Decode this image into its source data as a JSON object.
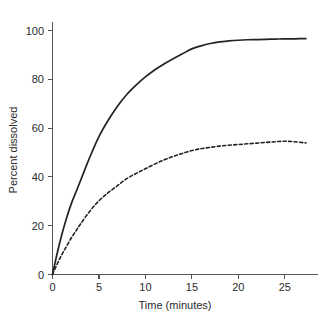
{
  "chart_data": {
    "type": "line",
    "title": "",
    "xlabel": "Time (minutes)",
    "ylabel": "Percent dissolved",
    "xlim": [
      0,
      28.6
    ],
    "ylim": [
      0,
      108
    ],
    "xticks": [
      0,
      5,
      10,
      15,
      20,
      25
    ],
    "yticks": [
      0,
      20,
      40,
      60,
      80,
      100
    ],
    "xtick_labels": [
      "0",
      "5",
      "10",
      "15",
      "20",
      "25"
    ],
    "ytick_labels": [
      "0",
      "20",
      "40",
      "60",
      "80",
      "100"
    ],
    "grid": false,
    "legend": "none",
    "x": [
      0,
      0.5,
      1,
      1.5,
      2,
      2.5,
      3,
      4,
      5,
      6,
      7,
      8,
      9,
      10,
      11,
      12,
      13,
      14,
      15,
      16,
      17,
      18,
      19,
      20,
      21,
      22,
      23,
      24,
      25,
      26,
      27,
      27.3
    ],
    "series": [
      {
        "name": "solid-curve",
        "style": "solid",
        "color": "#232323",
        "values": [
          0,
          9,
          17,
          24,
          30,
          35,
          40,
          50,
          59,
          66,
          72,
          77,
          81,
          84.5,
          87.5,
          90,
          92.3,
          94.4,
          96.5,
          97.8,
          98.8,
          99.5,
          99.9,
          100.2,
          100.4,
          100.5,
          100.6,
          100.7,
          100.8,
          100.8,
          100.9,
          100.9
        ]
      },
      {
        "name": "dashed-curve",
        "style": "dashed",
        "color": "#232323",
        "values": [
          0,
          4.5,
          8.5,
          12,
          15.5,
          18.5,
          21.5,
          27,
          31.5,
          35,
          38,
          41,
          43.2,
          45.2,
          47.2,
          49,
          50.5,
          51.8,
          53,
          53.8,
          54.4,
          54.9,
          55.3,
          55.6,
          55.9,
          56.2,
          56.5,
          56.8,
          57,
          56.8,
          56.4,
          56.3
        ]
      }
    ]
  },
  "axes": {
    "y_axis_name": "y-axis",
    "x_axis_name": "x-axis"
  }
}
